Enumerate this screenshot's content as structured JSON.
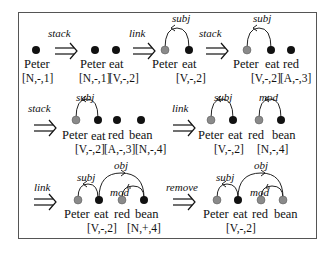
{
  "diagram": {
    "colors": {
      "active_node": "#111111",
      "reduced_node": "#8a8a8a",
      "border": "#555555"
    },
    "steps": [
      {
        "operation": "",
        "words": [
          "Peter"
        ],
        "features": [
          "[N,-,1]"
        ]
      },
      {
        "operation": "stack",
        "words": [
          "Peter",
          "eat"
        ],
        "features": [
          "[N,-,1]",
          "[V,-,2]"
        ]
      },
      {
        "operation": "link",
        "words": [
          "Peter",
          "eat"
        ],
        "features": [
          "[V,-,2]"
        ],
        "arcs": [
          "subj"
        ]
      },
      {
        "operation": "stack",
        "words": [
          "Peter",
          "eat",
          "red"
        ],
        "features": [
          "[V,-,2]",
          "[A,-,3]"
        ],
        "arcs": [
          "subj"
        ]
      },
      {
        "operation": "stack",
        "words": [
          "Peter",
          "eat",
          "red",
          "bean"
        ],
        "features": [
          "[V,-,2]",
          "[A,-,3]",
          "[N,-,4]"
        ],
        "arcs": [
          "subj"
        ]
      },
      {
        "operation": "link",
        "words": [
          "Peter",
          "eat",
          "red",
          "bean"
        ],
        "features": [
          "[V,-,2]",
          "[N,-,4]"
        ],
        "arcs": [
          "subj",
          "mod"
        ]
      },
      {
        "operation": "link",
        "words": [
          "Peter",
          "eat",
          "red",
          "bean"
        ],
        "features": [
          "[V,-,2]",
          "[N,+,4]"
        ],
        "arcs": [
          "subj",
          "mod",
          "obj"
        ]
      },
      {
        "operation": "remove",
        "words": [
          "Peter",
          "eat",
          "red",
          "bean"
        ],
        "features": [
          "[V,-,2]"
        ],
        "arcs": [
          "subj",
          "mod",
          "obj"
        ]
      }
    ]
  },
  "t": {
    "stack": "stack",
    "link": "link",
    "remove": "remove",
    "peter": "Peter",
    "eat": "eat",
    "red": "red",
    "bean": "bean",
    "subj": "subj",
    "mod": "mod",
    "obj": "obj",
    "n1": "[N,-,1]",
    "v2": "[V,-,2]",
    "a3": "[A,-,3]",
    "n4": "[N,-,4]",
    "n4p": "[N,+,4]"
  }
}
